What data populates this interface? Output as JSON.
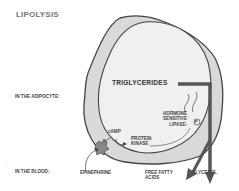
{
  "title": "LIPOLYSIS",
  "regions": {
    "adipocyte": "IN THE ADIPOCYTE:",
    "blood": "IN THE BLOOD:"
  },
  "nodes": {
    "triglycerides": "TRIGLYCERIDES",
    "hsl_line1": "HORMONE",
    "hsl_line2": "SENSITIVE",
    "hsl_line3": "LIPASE-",
    "phosphate": "P",
    "camp": "cAMP",
    "pk_line1": "PROTEIN",
    "pk_line2": "KINASE",
    "epinephrine": "EPINEPHRINE",
    "ffa_line1": "FREE FATTY",
    "ffa_line2": "ACIDS",
    "glycerol": "GLYCEROL"
  },
  "colors": {
    "cell_fill": "#d9d9d9",
    "droplet_fill": "#efefef",
    "outline": "#444444",
    "arrow": "#555555"
  }
}
